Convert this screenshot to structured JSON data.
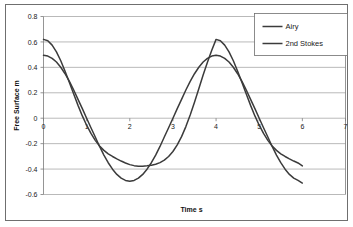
{
  "chart_data": {
    "type": "line",
    "title": "",
    "xlabel": "Time s",
    "ylabel": "Free Surface m",
    "xlim": [
      0,
      7
    ],
    "ylim": [
      -0.6,
      0.8
    ],
    "xticks": [
      0,
      1,
      2,
      3,
      4,
      5,
      6,
      7
    ],
    "xtick_labels": [
      "0",
      "1",
      "2",
      "3",
      "4",
      "5",
      "6",
      "7"
    ],
    "yticks": [
      -0.6,
      -0.4,
      -0.2,
      0,
      0.2,
      0.4,
      0.6,
      0.8
    ],
    "ytick_labels": [
      "-0.6",
      "-0.4",
      "-0.2",
      "0",
      "0.2",
      "0.4",
      "0.6",
      "0.8"
    ],
    "grid": "horizontal",
    "legend_position": "top-right",
    "series": [
      {
        "name": "Airy",
        "color": "#3b3b3b",
        "amplitude": 0.5,
        "period": 4,
        "phase_deg": 90,
        "x": [
          0,
          0.1,
          0.2,
          0.3,
          0.4,
          0.5,
          0.6,
          0.7,
          0.8,
          0.9,
          1,
          1.1,
          1.2,
          1.3,
          1.4,
          1.5,
          1.6,
          1.7,
          1.8,
          1.9,
          2,
          2.1,
          2.2,
          2.3,
          2.4,
          2.5,
          2.6,
          2.7,
          2.8,
          2.9,
          3,
          3.1,
          3.2,
          3.3,
          3.4,
          3.5,
          3.6,
          3.7,
          3.8,
          3.9,
          4,
          4.1,
          4.2,
          4.3,
          4.4,
          4.5,
          4.6,
          4.7,
          4.8,
          4.9,
          5,
          5.1,
          5.2,
          5.3,
          5.4,
          5.5,
          5.6,
          5.7,
          5.8,
          5.9,
          6
        ],
        "y": [
          0.495,
          0.489,
          0.471,
          0.442,
          0.401,
          0.35,
          0.29,
          0.222,
          0.148,
          0.075,
          0,
          -0.075,
          -0.148,
          -0.222,
          -0.29,
          -0.35,
          -0.401,
          -0.442,
          -0.471,
          -0.489,
          -0.495,
          -0.489,
          -0.471,
          -0.442,
          -0.401,
          -0.35,
          -0.29,
          -0.222,
          -0.148,
          -0.075,
          0,
          0.075,
          0.148,
          0.222,
          0.29,
          0.35,
          0.401,
          0.442,
          0.471,
          0.489,
          0.495,
          0.489,
          0.471,
          0.442,
          0.401,
          0.35,
          0.29,
          0.222,
          0.148,
          0.075,
          0,
          -0.075,
          -0.148,
          -0.222,
          -0.29,
          -0.35,
          -0.401,
          -0.442,
          -0.471,
          -0.489,
          -0.51
        ]
      },
      {
        "name": "2nd Stokes",
        "color": "#3b3b3b",
        "amplitude_first": 0.5,
        "amplitude_second": 0.12,
        "period": 4,
        "x": [
          0,
          0.1,
          0.2,
          0.3,
          0.4,
          0.5,
          0.6,
          0.7,
          0.8,
          0.9,
          1,
          1.1,
          1.2,
          1.3,
          1.4,
          1.5,
          1.6,
          1.7,
          1.8,
          1.9,
          2,
          2.1,
          2.2,
          2.3,
          2.4,
          2.5,
          2.6,
          2.7,
          2.8,
          2.9,
          3,
          3.1,
          3.2,
          3.3,
          3.4,
          3.5,
          3.6,
          3.7,
          3.8,
          3.9,
          4,
          4.1,
          4.2,
          4.3,
          4.4,
          4.5,
          4.6,
          4.7,
          4.8,
          4.9,
          5,
          5.1,
          5.2,
          5.3,
          5.4,
          5.5,
          5.6,
          5.7,
          5.8,
          5.9,
          6
        ],
        "y": [
          0.62,
          0.61,
          0.575,
          0.522,
          0.452,
          0.37,
          0.281,
          0.19,
          0.101,
          0.018,
          -0.055,
          -0.12,
          -0.174,
          -0.218,
          -0.253,
          -0.28,
          -0.301,
          -0.32,
          -0.337,
          -0.352,
          -0.365,
          -0.373,
          -0.377,
          -0.377,
          -0.374,
          -0.37,
          -0.362,
          -0.349,
          -0.33,
          -0.301,
          -0.262,
          -0.21,
          -0.145,
          -0.066,
          0.025,
          0.125,
          0.232,
          0.34,
          0.44,
          0.535,
          0.62,
          0.61,
          0.575,
          0.522,
          0.452,
          0.37,
          0.281,
          0.19,
          0.101,
          0.018,
          -0.055,
          -0.12,
          -0.174,
          -0.218,
          -0.253,
          -0.28,
          -0.301,
          -0.32,
          -0.337,
          -0.352,
          -0.375
        ]
      }
    ],
    "legend": [
      {
        "label": "Airy"
      },
      {
        "label": "2nd Stokes"
      }
    ]
  },
  "legend": {
    "items": [
      {
        "label": "Airy"
      },
      {
        "label": "2nd Stokes"
      }
    ]
  },
  "axes": {
    "x_title": "Time s",
    "y_title": "Free Surface m"
  }
}
